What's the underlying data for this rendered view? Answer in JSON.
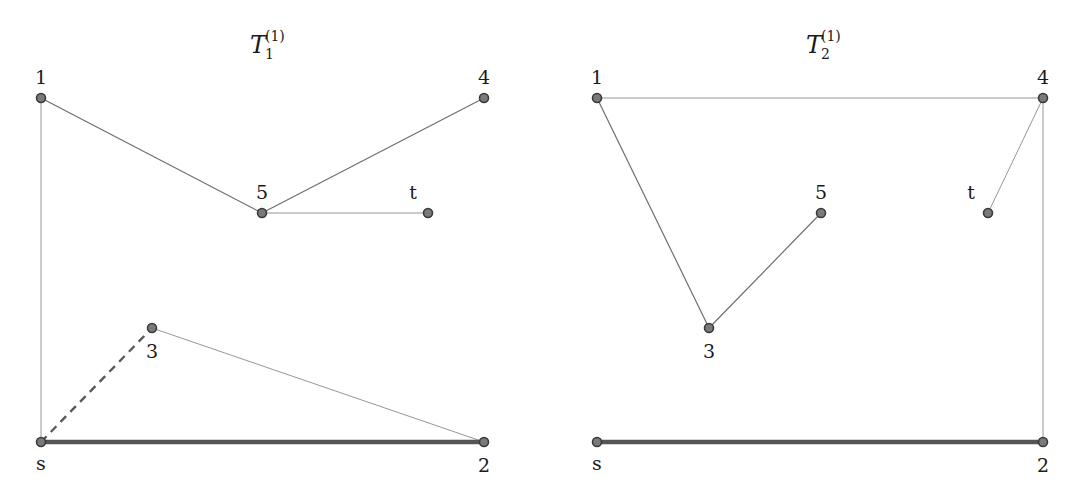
{
  "graphs": [
    {
      "title": {
        "base": "T",
        "subscript": "1",
        "superscript": "(1)"
      },
      "title_pos": [
        262,
        45
      ],
      "nodes": [
        {
          "id": "1",
          "label": "1",
          "x": 41,
          "y": 98,
          "lx": 41,
          "ly": 84
        },
        {
          "id": "4",
          "label": "4",
          "x": 484,
          "y": 98,
          "lx": 484,
          "ly": 84
        },
        {
          "id": "5",
          "label": "5",
          "x": 262,
          "y": 213,
          "lx": 262,
          "ly": 199
        },
        {
          "id": "t",
          "label": "t",
          "x": 428,
          "y": 213,
          "lx": 413,
          "ly": 199
        },
        {
          "id": "3",
          "label": "3",
          "x": 152,
          "y": 328,
          "lx": 152,
          "ly": 358
        },
        {
          "id": "s",
          "label": "s",
          "x": 41,
          "y": 442,
          "lx": 41,
          "ly": 470
        },
        {
          "id": "2",
          "label": "2",
          "x": 484,
          "y": 442,
          "lx": 484,
          "ly": 472
        }
      ],
      "edges": [
        {
          "from": "1",
          "to": "s",
          "style": "thin"
        },
        {
          "from": "1",
          "to": "5",
          "style": "normal"
        },
        {
          "from": "5",
          "to": "4",
          "style": "normal"
        },
        {
          "from": "5",
          "to": "t",
          "style": "thin"
        },
        {
          "from": "3",
          "to": "2",
          "style": "thin"
        },
        {
          "from": "s",
          "to": "3",
          "style": "dashed"
        },
        {
          "from": "s",
          "to": "2",
          "style": "thick"
        }
      ]
    },
    {
      "title": {
        "base": "T",
        "subscript": "2",
        "superscript": "(1)"
      },
      "title_pos": [
        818,
        45
      ],
      "nodes": [
        {
          "id": "1",
          "label": "1",
          "x": 597,
          "y": 98,
          "lx": 597,
          "ly": 84
        },
        {
          "id": "4",
          "label": "4",
          "x": 1043,
          "y": 98,
          "lx": 1043,
          "ly": 84
        },
        {
          "id": "5",
          "label": "5",
          "x": 821,
          "y": 213,
          "lx": 821,
          "ly": 199
        },
        {
          "id": "t",
          "label": "t",
          "x": 988,
          "y": 213,
          "lx": 971,
          "ly": 199
        },
        {
          "id": "3",
          "label": "3",
          "x": 709,
          "y": 328,
          "lx": 709,
          "ly": 358
        },
        {
          "id": "s",
          "label": "s",
          "x": 597,
          "y": 442,
          "lx": 597,
          "ly": 470
        },
        {
          "id": "2",
          "label": "2",
          "x": 1043,
          "y": 442,
          "lx": 1043,
          "ly": 472
        }
      ],
      "edges": [
        {
          "from": "1",
          "to": "4",
          "style": "thin"
        },
        {
          "from": "1",
          "to": "3",
          "style": "normal"
        },
        {
          "from": "3",
          "to": "5",
          "style": "normal"
        },
        {
          "from": "4",
          "to": "t",
          "style": "thin"
        },
        {
          "from": "4",
          "to": "2",
          "style": "thin"
        },
        {
          "from": "s",
          "to": "2",
          "style": "thick"
        }
      ]
    }
  ],
  "colors": {
    "node_fill": "#7a7a7a",
    "node_stroke": "#3a3a3a",
    "edge": "#6e6e6e",
    "thick_edge": "#555555",
    "text": "#1a1a1a"
  }
}
